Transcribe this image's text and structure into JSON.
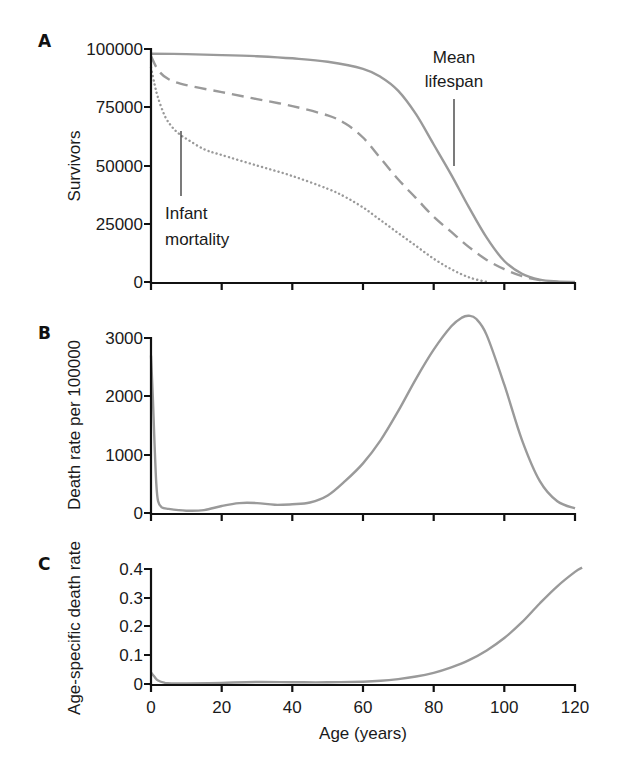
{
  "chart_data": [
    {
      "panel": "A",
      "type": "line",
      "title": "",
      "xlabel": "",
      "ylabel": "Survivors",
      "xlim": [
        0,
        120
      ],
      "ylim": [
        0,
        100000
      ],
      "yticks": [
        0,
        25000,
        50000,
        75000,
        100000
      ],
      "xticks": [
        0,
        20,
        40,
        60,
        80,
        100,
        120
      ],
      "grid": false,
      "series": [
        {
          "name": "solid",
          "style": "solid",
          "x": [
            0,
            10,
            20,
            30,
            40,
            50,
            60,
            65,
            70,
            75,
            80,
            85,
            90,
            95,
            100,
            105,
            110,
            115,
            120
          ],
          "values": [
            98000,
            97800,
            97400,
            96900,
            96000,
            94500,
            91500,
            88000,
            82000,
            72000,
            59000,
            46000,
            32000,
            19000,
            9000,
            3500,
            1000,
            200,
            0
          ]
        },
        {
          "name": "dashed",
          "style": "dashed",
          "x": [
            0,
            2,
            5,
            10,
            20,
            30,
            40,
            50,
            55,
            60,
            65,
            70,
            75,
            80,
            85,
            90,
            95,
            100,
            105,
            110,
            115
          ],
          "values": [
            97000,
            91000,
            87000,
            84500,
            81500,
            78500,
            75500,
            71500,
            68000,
            62000,
            53000,
            44000,
            36000,
            28000,
            21500,
            15000,
            9500,
            5500,
            2500,
            800,
            0
          ]
        },
        {
          "name": "dotted",
          "style": "dotted",
          "x": [
            0,
            1,
            2,
            4,
            6,
            8,
            10,
            15,
            20,
            30,
            40,
            50,
            55,
            60,
            65,
            70,
            75,
            80,
            85,
            90,
            95
          ],
          "values": [
            92000,
            85000,
            79000,
            71000,
            66500,
            63500,
            61500,
            57000,
            54500,
            50000,
            45500,
            40000,
            36500,
            32000,
            26500,
            21000,
            15500,
            10000,
            5500,
            2000,
            0
          ]
        }
      ],
      "annotations": [
        {
          "text": "Mean lifespan",
          "x": 86,
          "y": 46000
        },
        {
          "text": "Infant mortality",
          "x": 9,
          "y": 62000
        }
      ]
    },
    {
      "panel": "B",
      "type": "line",
      "title": "",
      "xlabel": "",
      "ylabel": "Death rate per 100000",
      "xlim": [
        0,
        120
      ],
      "ylim": [
        0,
        3000
      ],
      "yticks": [
        0,
        1000,
        2000,
        3000
      ],
      "xticks": [
        0,
        20,
        40,
        60,
        80,
        100,
        120
      ],
      "grid": false,
      "series": [
        {
          "name": "death rate",
          "style": "solid",
          "x": [
            0,
            0.5,
            1,
            1.5,
            2,
            3,
            5,
            10,
            15,
            20,
            25,
            30,
            35,
            40,
            45,
            50,
            55,
            60,
            65,
            70,
            75,
            80,
            85,
            88,
            90,
            92,
            95,
            100,
            105,
            110,
            115,
            120
          ],
          "values": [
            2700,
            2000,
            1200,
            500,
            200,
            100,
            70,
            40,
            50,
            120,
            170,
            170,
            140,
            150,
            180,
            300,
            550,
            850,
            1250,
            1750,
            2300,
            2800,
            3200,
            3350,
            3380,
            3330,
            3050,
            2200,
            1250,
            550,
            200,
            80
          ]
        }
      ]
    },
    {
      "panel": "C",
      "type": "line",
      "title": "",
      "xlabel": "Age (years)",
      "ylabel": "Age-specific death rate",
      "xlim": [
        0,
        120
      ],
      "ylim": [
        0,
        0.4
      ],
      "yticks": [
        0,
        0.1,
        0.2,
        0.3,
        0.4
      ],
      "xticks": [
        0,
        20,
        40,
        60,
        80,
        100,
        120
      ],
      "grid": false,
      "series": [
        {
          "name": "age-specific death rate",
          "style": "solid",
          "x": [
            0,
            1,
            2,
            4,
            6,
            10,
            20,
            30,
            40,
            50,
            60,
            65,
            70,
            75,
            80,
            85,
            90,
            95,
            100,
            105,
            110,
            115,
            120,
            122
          ],
          "values": [
            0.04,
            0.025,
            0.012,
            0.004,
            0.002,
            0.002,
            0.004,
            0.007,
            0.006,
            0.006,
            0.008,
            0.011,
            0.017,
            0.026,
            0.039,
            0.058,
            0.083,
            0.117,
            0.16,
            0.215,
            0.28,
            0.34,
            0.39,
            0.405
          ]
        }
      ]
    }
  ],
  "panels": {
    "A": {
      "letter": "A",
      "ylabel": "Survivors",
      "yticks": [
        "100000",
        "75000",
        "50000",
        "25000",
        "0"
      ],
      "annot_mean": [
        "Mean",
        "lifespan"
      ],
      "annot_infant": [
        "Infant",
        "mortality"
      ]
    },
    "B": {
      "letter": "B",
      "ylabel": "Death rate per 100000",
      "yticks": [
        "3000",
        "2000",
        "1000",
        "0"
      ]
    },
    "C": {
      "letter": "C",
      "ylabel": "Age-specific death rate",
      "yticks": [
        "0.4",
        "0.3",
        "0.2",
        "0.1",
        "0"
      ],
      "xticks": [
        "0",
        "20",
        "40",
        "60",
        "80",
        "100",
        "120"
      ],
      "xlabel": "Age (years)"
    }
  },
  "colors": {
    "curve": "#9a9a9a",
    "axis": "#111111"
  }
}
